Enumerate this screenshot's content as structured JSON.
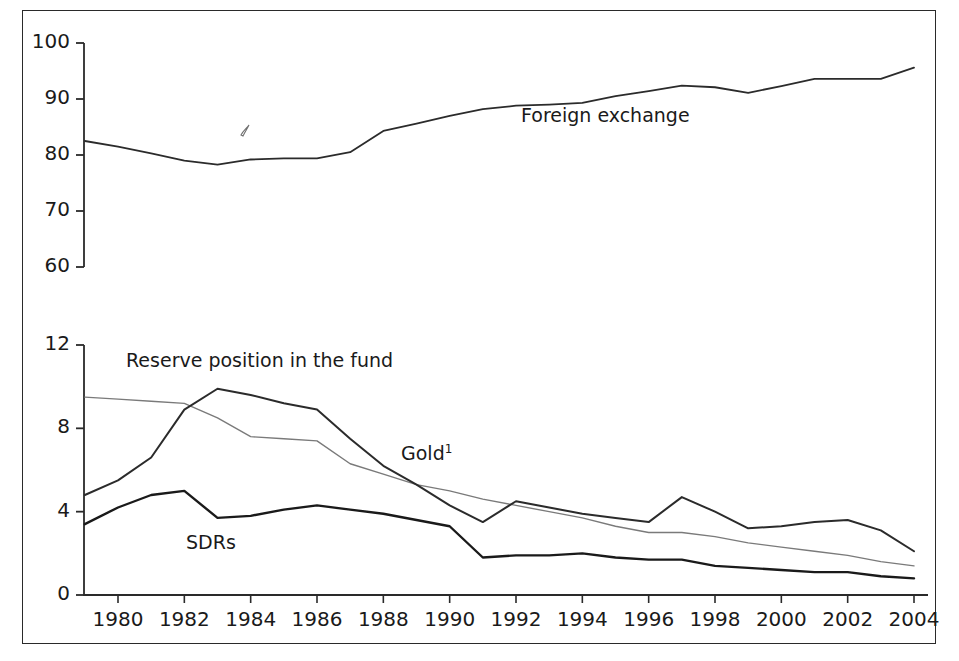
{
  "chart_data": {
    "type": "line",
    "title": "",
    "subtitle": "",
    "xlabel": "",
    "ylabel": "",
    "grid": false,
    "legend_position": "inline-annotations",
    "panels": [
      {
        "name": "upper-panel",
        "ylim": [
          60,
          100
        ],
        "yticks": [
          60,
          70,
          80,
          90,
          100
        ],
        "ytick_labels": [
          "60",
          "70",
          "80",
          "90",
          "100"
        ],
        "xlim": [
          1979,
          2004
        ],
        "series": [
          {
            "name": "Foreign exchange",
            "label": "Foreign exchange",
            "color": "#2b2b2b",
            "width": 1.8,
            "x": [
              1979,
              1980,
              1981,
              1982,
              1983,
              1984,
              1985,
              1986,
              1987,
              1988,
              1989,
              1990,
              1991,
              1992,
              1993,
              1994,
              1995,
              1996,
              1997,
              1998,
              1999,
              2000,
              2001,
              2002,
              2003,
              2004
            ],
            "values": [
              82.5,
              81.5,
              80.3,
              79.0,
              78.3,
              79.2,
              79.4,
              79.4,
              80.5,
              84.3,
              85.6,
              87.0,
              88.2,
              88.8,
              89.0,
              89.3,
              90.5,
              91.4,
              92.4,
              92.1,
              91.1,
              92.3,
              93.6,
              93.6,
              93.6,
              95.6
            ]
          }
        ]
      },
      {
        "name": "lower-panel",
        "ylim": [
          0,
          12
        ],
        "yticks": [
          0,
          4,
          8,
          12
        ],
        "ytick_labels": [
          "0",
          "4",
          "8",
          "12"
        ],
        "xlim": [
          1979,
          2004
        ],
        "series": [
          {
            "name": "Gold",
            "label": "Gold",
            "label_superscript": "1",
            "color": "#7a7a7a",
            "width": 1.4,
            "x": [
              1979,
              1980,
              1981,
              1982,
              1983,
              1984,
              1985,
              1986,
              1987,
              1988,
              1989,
              1990,
              1991,
              1992,
              1993,
              1994,
              1995,
              1996,
              1997,
              1998,
              1999,
              2000,
              2001,
              2002,
              2003,
              2004
            ],
            "values": [
              9.5,
              9.4,
              9.3,
              9.2,
              8.5,
              7.6,
              7.5,
              7.4,
              6.3,
              5.8,
              5.3,
              5.0,
              4.6,
              4.3,
              4.0,
              3.7,
              3.3,
              3.0,
              3.0,
              2.8,
              2.5,
              2.3,
              2.1,
              1.9,
              1.6,
              1.4
            ]
          },
          {
            "name": "Reserve position in the fund",
            "label": "Reserve position in the fund",
            "color": "#2b2b2b",
            "width": 2.0,
            "x": [
              1979,
              1980,
              1981,
              1982,
              1983,
              1984,
              1985,
              1986,
              1987,
              1988,
              1989,
              1990,
              1991,
              1992,
              1993,
              1994,
              1995,
              1996,
              1997,
              1998,
              1999,
              2000,
              2001,
              2002,
              2003,
              2004
            ],
            "values": [
              4.8,
              5.5,
              6.6,
              8.9,
              9.9,
              9.6,
              9.2,
              8.9,
              7.5,
              6.2,
              5.3,
              4.3,
              3.5,
              4.5,
              4.2,
              3.9,
              3.7,
              3.5,
              4.7,
              4.0,
              3.2,
              3.3,
              3.5,
              3.6,
              3.1,
              2.1
            ]
          },
          {
            "name": "SDRs",
            "label": "SDRs",
            "color": "#1a1a1a",
            "width": 2.4,
            "x": [
              1979,
              1980,
              1981,
              1982,
              1983,
              1984,
              1985,
              1986,
              1987,
              1988,
              1989,
              1990,
              1991,
              1992,
              1993,
              1994,
              1995,
              1996,
              1997,
              1998,
              1999,
              2000,
              2001,
              2002,
              2003,
              2004
            ],
            "values": [
              3.4,
              4.2,
              4.8,
              5.0,
              3.7,
              3.8,
              4.1,
              4.3,
              4.1,
              3.9,
              3.6,
              3.3,
              1.8,
              1.9,
              1.9,
              2.0,
              1.8,
              1.7,
              1.7,
              1.4,
              1.3,
              1.2,
              1.1,
              1.1,
              0.9,
              0.8
            ]
          }
        ]
      }
    ],
    "xticks": [
      1980,
      1982,
      1984,
      1986,
      1988,
      1990,
      1992,
      1994,
      1996,
      1998,
      2000,
      2002,
      2004
    ],
    "xtick_labels": [
      "1980",
      "1982",
      "1984",
      "1986",
      "1988",
      "1990",
      "1992",
      "1994",
      "1996",
      "1998",
      "2000",
      "2002",
      "2004"
    ],
    "annotations": [
      {
        "name": "foreign-exchange-label",
        "text": "Foreign exchange",
        "x": 1991.0,
        "panel": "upper",
        "px": 521,
        "py": 104
      },
      {
        "name": "reserve-position-label",
        "text": "Reserve position in the fund",
        "x": 1981.0,
        "panel": "lower",
        "px": 126,
        "py": 349
      },
      {
        "name": "gold-label",
        "text": "Gold",
        "superscript": "1",
        "panel": "lower",
        "px": 401,
        "py": 442
      },
      {
        "name": "sdrs-label",
        "text": "SDRs",
        "panel": "lower",
        "px": 186,
        "py": 531
      }
    ],
    "colors": {
      "axis": "#2a2a2a",
      "frame": "#2a2a2a",
      "foreign_exchange": "#2b2b2b",
      "gold": "#7a7a7a",
      "reserve_position": "#2b2b2b",
      "sdrs": "#1a1a1a",
      "background": "#ffffff",
      "text": "#1a1a1a"
    }
  }
}
